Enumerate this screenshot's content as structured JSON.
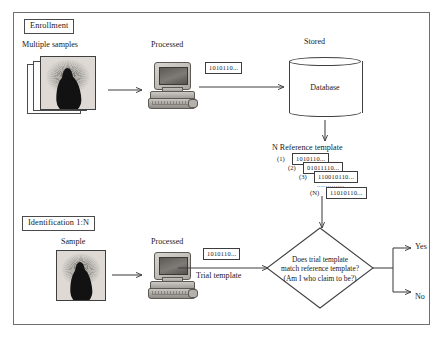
{
  "diagram": {
    "border_color": "#6f6f6f"
  },
  "enrollment": {
    "section_label": "Enrollment",
    "sample_caption": "Multiple samples",
    "processed_caption": "Processed",
    "stored_caption": "Stored",
    "template_binary": "1010110...",
    "database_label": "Database"
  },
  "reference": {
    "heading": "N Reference template",
    "rows": [
      {
        "index": "(1)",
        "value": "1010110..."
      },
      {
        "index": "(2)",
        "value": "01011110..."
      },
      {
        "index": "(3)",
        "value": "110010110..."
      },
      {
        "index": "(N)",
        "value": "11010110..."
      }
    ],
    "ellipsis": "............."
  },
  "identification": {
    "section_label": "Identification 1:N",
    "sample_caption": "Sample",
    "processed_caption": "Processed",
    "trial_binary": "1010110...",
    "trial_caption": "Trial template"
  },
  "decision": {
    "line1": "Does trial template",
    "line2": "match reference template?",
    "line3": "(Am I who claim to be?)",
    "yes_label": "Yes",
    "no_label": "No"
  }
}
